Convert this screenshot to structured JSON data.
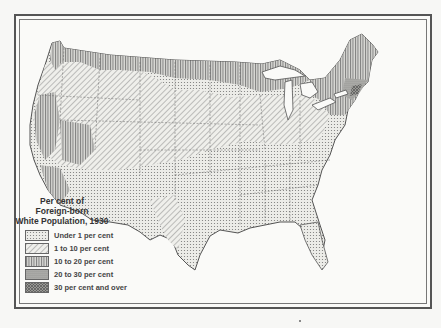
{
  "map": {
    "subject": "United States",
    "legend": {
      "title_lines": [
        "Per cent of",
        "Foreign-born",
        "White Population, 1930"
      ],
      "items": [
        {
          "label": "Under 1 per cent",
          "pattern": "fine-dots",
          "color": "#d8d8d4"
        },
        {
          "label": "1 to 10 per cent",
          "pattern": "diagonal-hatch",
          "color": "#cfcfcb"
        },
        {
          "label": "10 to 20 per cent",
          "pattern": "vertical-lines",
          "color": "#bdbdb9"
        },
        {
          "label": "20 to 30 per cent",
          "pattern": "dense-dots",
          "color": "#a9a9a5"
        },
        {
          "label": "30 per cent and over",
          "pattern": "dark-crosshatch",
          "color": "#8d8d89"
        }
      ]
    }
  }
}
